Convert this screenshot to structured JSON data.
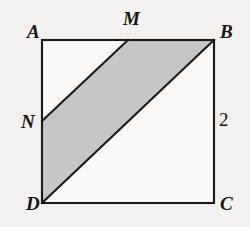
{
  "figure": {
    "type": "geometry-diagram",
    "background_color": "#f3f1ef",
    "stroke_color": "#1a1a1a",
    "shaded_fill_color": "#c6c6c6",
    "unshaded_fill_color": "#fbfaf8",
    "square": {
      "vertices": [
        {
          "id": "A",
          "label": "A",
          "x": 42,
          "y": 40
        },
        {
          "id": "B",
          "label": "B",
          "x": 214,
          "y": 40
        },
        {
          "id": "C",
          "label": "C",
          "x": 214,
          "y": 203
        },
        {
          "id": "D",
          "label": "D",
          "x": 42,
          "y": 203
        }
      ]
    },
    "points": [
      {
        "id": "M",
        "label": "M",
        "x": 128,
        "y": 40,
        "on_segment": "AB"
      },
      {
        "id": "N",
        "label": "N",
        "x": 42,
        "y": 121,
        "on_segment": "AD"
      }
    ],
    "shaded_region": {
      "name": "parallelogram-NMBD",
      "polygon": "42,121 128,40 214,40 42,203"
    },
    "segments": [
      {
        "name": "segment-NM",
        "from": "N",
        "to": "M"
      },
      {
        "name": "segment-DB",
        "from": "D",
        "to": "B"
      }
    ],
    "measurements": [
      {
        "name": "side-BC-length",
        "value": "2",
        "side": "BC",
        "x": 222,
        "y": 120
      }
    ],
    "labels": {
      "A": "A",
      "B": "B",
      "C": "C",
      "D": "D",
      "M": "M",
      "N": "N",
      "side_2": "2"
    }
  }
}
